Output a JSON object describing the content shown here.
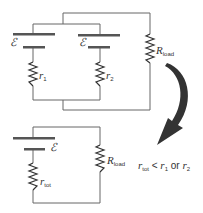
{
  "diagram": {
    "top_circuit": {
      "battery1": {
        "emf": "ℰ",
        "resistor": "r",
        "resistor_sub": "1"
      },
      "battery2": {
        "emf": "ℰ",
        "resistor": "r",
        "resistor_sub": "2"
      },
      "load": {
        "label": "R",
        "sub": "load"
      }
    },
    "bottom_circuit": {
      "battery": {
        "emf": "ℰ",
        "resistor": "r",
        "resistor_sub": "tot"
      },
      "load": {
        "label": "R",
        "sub": "load"
      }
    },
    "relation": {
      "lhs": "r",
      "lhs_sub": "tot",
      "op": "<",
      "a": "r",
      "a_sub": "1",
      "or": "or",
      "b": "r",
      "b_sub": "2"
    },
    "colors": {
      "wire": "#555555",
      "plate": "#555555",
      "arrow": "#333333"
    }
  }
}
